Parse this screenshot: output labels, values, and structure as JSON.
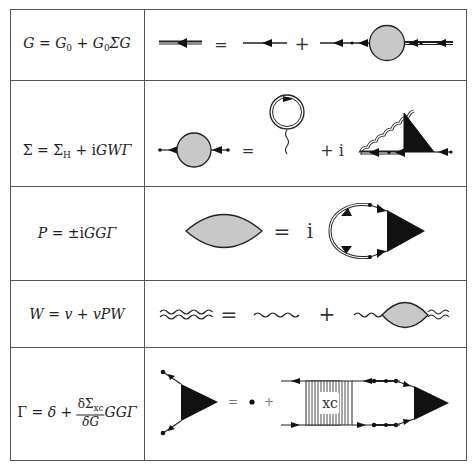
{
  "table": {
    "rows": [
      {
        "id": "dyson",
        "equation": {
          "lhs": "G",
          "rhs_parts": [
            "G",
            "0",
            " + ",
            "G",
            "0",
            "ΣG"
          ]
        },
        "equation_text": "G = G_0 + G_0 Σ G",
        "diagram_symbols": {
          "equals": "=",
          "plus": "+"
        }
      },
      {
        "id": "self-energy",
        "equation_text": "Σ = Σ_H + iGWΓ",
        "diagram_symbols": {
          "equals": "=",
          "plus_i": "+ i"
        }
      },
      {
        "id": "polarization",
        "equation_text": "P = ±iGGΓ",
        "diagram_symbols": {
          "equals": "=",
          "i": "i"
        }
      },
      {
        "id": "screened-interaction",
        "equation_text": "W = v + vPW",
        "diagram_symbols": {
          "equals": "=",
          "plus": "+"
        }
      },
      {
        "id": "vertex",
        "equation_text": "Γ = δ + (δΣ_xc/δG) GGΓ",
        "diagram_symbols": {
          "equals": "=",
          "plus": "+",
          "kernel_label": "xc"
        }
      }
    ]
  },
  "labels": {
    "r1": {
      "G": "G",
      "eq": " = ",
      "G0a": "G",
      "sub0a": "0",
      "plus": " + ",
      "G0b": "G",
      "sub0b": "0",
      "SigmaG": "ΣG"
    },
    "r2": {
      "Sigma": "Σ",
      "eq": " = ",
      "SigmaH": "Σ",
      "subH": "H",
      "plus": " + i",
      "GWG": "GWΓ"
    },
    "r3": {
      "P": "P",
      "eq": " = ±i",
      "GGG": "GGΓ"
    },
    "r4": {
      "W": "W",
      "eq": " = ",
      "v1": "v",
      "plus": " + ",
      "vPW": "vPW"
    },
    "r5": {
      "Gamma": "Γ",
      "eq": " = ",
      "delta": "δ",
      "plus": " + ",
      "num": "δΣ",
      "numsub": "xc",
      "den": "δG",
      "GGG": "GGΓ"
    }
  },
  "colors": {
    "border": "#555555",
    "line": "#222222",
    "shaded_fill": "#c8c8c8",
    "vertex_fill": "#111111",
    "background": "#ffffff"
  }
}
